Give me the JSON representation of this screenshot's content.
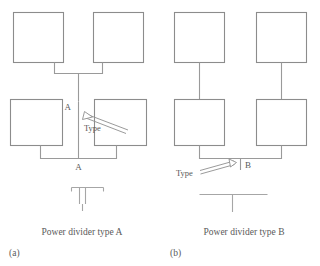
{
  "figure": {
    "colors": {
      "line": "#9a9a9a",
      "box_stroke": "#8c8c8c",
      "text": "#5a5a5a",
      "background": "#ffffff"
    }
  },
  "panel_a": {
    "subfigure_label": "(a)",
    "caption": "Power divider type A",
    "junction_label_upper": "A",
    "junction_label_lower": "A",
    "callout_label": "Type",
    "symbol_name": "tee-with-end-stubs-symbol",
    "boxes": [
      {
        "name": "top-left-element"
      },
      {
        "name": "top-right-element"
      },
      {
        "name": "bottom-left-element"
      },
      {
        "name": "bottom-right-element"
      }
    ]
  },
  "panel_b": {
    "subfigure_label": "(b)",
    "caption": "Power divider type B",
    "junction_label": "B",
    "callout_label": "Type",
    "symbol_name": "plain-tee-symbol",
    "boxes": [
      {
        "name": "top-left-element"
      },
      {
        "name": "top-right-element"
      },
      {
        "name": "bottom-left-element"
      },
      {
        "name": "bottom-right-element"
      }
    ]
  }
}
